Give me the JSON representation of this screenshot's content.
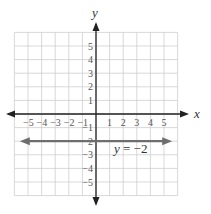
{
  "chart_data": {
    "type": "line",
    "title": "",
    "xlabel": "x",
    "ylabel": "y",
    "xlim": [
      -6,
      6
    ],
    "ylim": [
      -6,
      6
    ],
    "grid": true,
    "x_ticks": [
      "-5",
      "-4",
      "-3",
      "-2",
      "-1",
      "1",
      "2",
      "3",
      "4",
      "5"
    ],
    "y_ticks": [
      "5",
      "4",
      "3",
      "2",
      "1",
      "-1",
      "-2",
      "-3",
      "-4",
      "-5"
    ],
    "series": [
      {
        "name": "y = -2",
        "equation": "y = -2",
        "x": [
          -5.6,
          5.6
        ],
        "y": [
          -2,
          -2
        ],
        "color": "#6e6e6e",
        "arrows": "both"
      }
    ],
    "annotations": [
      {
        "text": "y = −2",
        "x": 1.4,
        "y": -2.5
      }
    ]
  },
  "labels": {
    "x_axis": "x",
    "y_axis": "y",
    "line_label": "y = −2"
  },
  "colors": {
    "axis": "#222222",
    "grid": "#c8c8c8",
    "line": "#6e6e6e"
  }
}
